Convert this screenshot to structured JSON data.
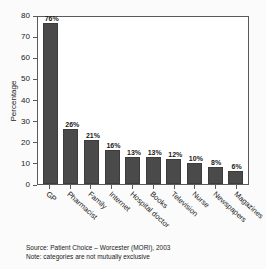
{
  "chart_data": {
    "type": "bar",
    "title": "",
    "xlabel": "",
    "ylabel": "Percentage",
    "ylim": [
      0,
      80
    ],
    "yticks": [
      0,
      10,
      20,
      30,
      40,
      50,
      60,
      70,
      80
    ],
    "ytick_labels": [
      "0",
      "10",
      "20",
      "30",
      "40",
      "50",
      "60",
      "70",
      "80"
    ],
    "grid": false,
    "legend": "none",
    "bar_color": "#4a4a4a",
    "categories": [
      "GP",
      "Pharmacist",
      "Family",
      "Internet",
      "Hospital doctor",
      "Books",
      "Television",
      "Nurse",
      "Newspapers",
      "Magazines"
    ],
    "values": [
      76,
      26,
      21,
      16,
      13,
      13,
      12,
      10,
      8,
      6
    ],
    "data_labels": [
      "76%",
      "26%",
      "21%",
      "16%",
      "13%",
      "13%",
      "12%",
      "10%",
      "8%",
      "6%"
    ]
  },
  "footnotes": [
    "Source: Patient Choice – Worcester (MORI), 2003",
    "Note: categories are not mutually exclusive"
  ]
}
